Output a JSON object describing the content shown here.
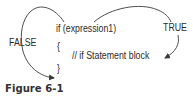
{
  "diagram": {
    "code": {
      "condition_line": "if (expression1)",
      "open_brace": "{",
      "block_comment": "// if Statement block",
      "close_brace": "}"
    },
    "branches": {
      "false_label": "FALSE",
      "true_label": "TRUE"
    },
    "colors": {
      "text": "#2b2b2b",
      "arrow": "#3a3a3a",
      "caption": "#333333"
    }
  },
  "caption": {
    "text": "Figure 6-1"
  }
}
